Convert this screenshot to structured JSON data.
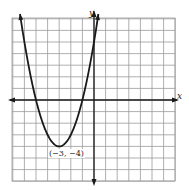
{
  "chart_data": {
    "type": "line",
    "title": "",
    "xlabel": "x",
    "ylabel": "y",
    "equation": "y = (x + 3)^2 - 4",
    "xlim": [
      -7,
      7
    ],
    "ylim": [
      -7,
      7
    ],
    "grid": true,
    "vertex": {
      "x": -3,
      "y": -4,
      "label": "(−3, −4)"
    },
    "x_intercepts": [
      -5,
      -1
    ],
    "series": [
      {
        "name": "parabola",
        "x": [
          -7,
          -6,
          -5,
          -4,
          -3,
          -2,
          -1,
          0,
          0.2
        ],
        "y": [
          12,
          5,
          0,
          -3,
          -4,
          -3,
          0,
          5,
          6.24
        ]
      }
    ]
  },
  "labels": {
    "x_axis": "x",
    "y_axis": "y",
    "vertex": "(−3, −4)"
  },
  "colors": {
    "grid": "#9a9a9a",
    "curve": "#1a1a1a",
    "axis": "#1a1a1a"
  }
}
